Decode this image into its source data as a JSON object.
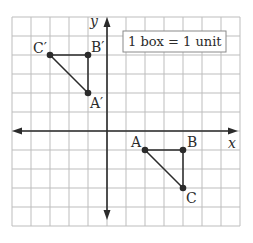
{
  "diagram": {
    "type": "coordinate-grid",
    "x_range": [
      -5,
      7
    ],
    "y_range": [
      -5,
      6
    ],
    "axis_labels": {
      "x": "x",
      "y": "y"
    },
    "scale_note": "1 box = 1 unit",
    "triangles": [
      {
        "name": "ABC",
        "points": [
          {
            "label": "A",
            "x": 2,
            "y": -1
          },
          {
            "label": "B",
            "x": 4,
            "y": -1
          },
          {
            "label": "C",
            "x": 4,
            "y": -3
          }
        ]
      },
      {
        "name": "A'B'C'",
        "points": [
          {
            "label": "A′",
            "x": -1,
            "y": 2
          },
          {
            "label": "B′",
            "x": -1,
            "y": 4
          },
          {
            "label": "C′",
            "x": -3,
            "y": 4
          }
        ]
      }
    ],
    "colors": {
      "ink": "#2b2b2b",
      "grid": "#bdbdbd"
    }
  }
}
